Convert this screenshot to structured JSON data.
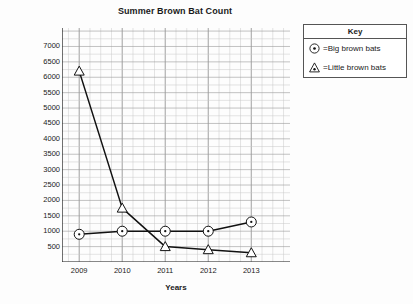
{
  "chart_data": {
    "type": "line",
    "title": "Summer Brown Bat Count",
    "xlabel": "Years",
    "ylabel": "Number of Bats",
    "categories": [
      "2009",
      "2010",
      "2011",
      "2012",
      "2013"
    ],
    "x": [
      2009,
      2010,
      2011,
      2012,
      2013
    ],
    "xlim": [
      2008.6,
      2013.9
    ],
    "ylim": [
      0,
      7600
    ],
    "ytick_labels": [
      "500",
      "1000",
      "1500",
      "2000",
      "2500",
      "3000",
      "3500",
      "4000",
      "4500",
      "5000",
      "5500",
      "6000",
      "6500",
      "7000"
    ],
    "ytick_values": [
      500,
      1000,
      1500,
      2000,
      2500,
      3000,
      3500,
      4000,
      4500,
      5000,
      5500,
      6000,
      6500,
      7000
    ],
    "grid": true,
    "legend_position": "outside-top-right",
    "series": [
      {
        "name": "Big brown bats",
        "marker": "circle-dot",
        "values": [
          900,
          1000,
          1000,
          1000,
          1300
        ]
      },
      {
        "name": "Little brown bats",
        "marker": "triangle",
        "values": [
          6200,
          1750,
          500,
          400,
          300
        ]
      }
    ]
  },
  "legend": {
    "title": "Key",
    "entries": [
      {
        "symbol": "circle-dot-marker-icon",
        "label": "=Big brown bats"
      },
      {
        "symbol": "triangle-marker-icon",
        "label": "=Little brown bats"
      }
    ]
  }
}
